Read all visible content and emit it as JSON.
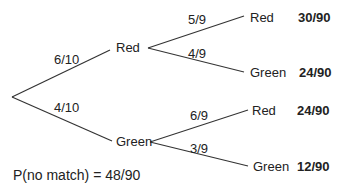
{
  "tree": {
    "level1": [
      {
        "label": "Red",
        "prob": "6/10"
      },
      {
        "label": "Green",
        "prob": "4/10"
      }
    ],
    "level2": [
      {
        "parent": "Red",
        "label": "Red",
        "prob": "5/9",
        "joint": "30/90"
      },
      {
        "parent": "Red",
        "label": "Green",
        "prob": "4/9",
        "joint": "24/90"
      },
      {
        "parent": "Green",
        "label": "Red",
        "prob": "6/9",
        "joint": "24/90"
      },
      {
        "parent": "Green",
        "label": "Green",
        "prob": "3/9",
        "joint": "12/90"
      }
    ]
  },
  "result": "P(no match) = 48/90"
}
